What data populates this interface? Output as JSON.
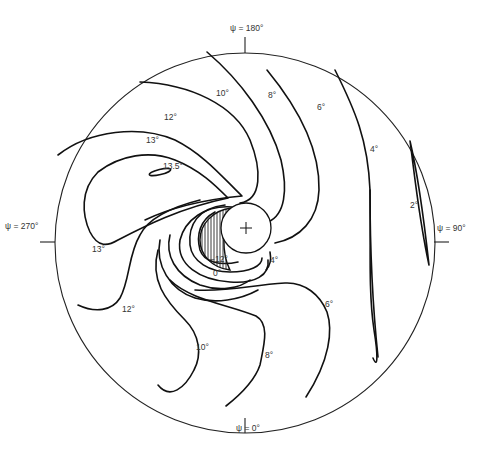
{
  "diagram": {
    "type": "polar contour map",
    "azimuth_labels": {
      "top": "ψ = 180°",
      "right": "ψ = 90°",
      "bottom": "ψ = 0°",
      "left": "ψ = 270°"
    },
    "contour_labels": {
      "c10_top": "10°",
      "c8_top": "8°",
      "c6_top": "6°",
      "c4": "4°",
      "c2": "2°",
      "c12_top": "12°",
      "c13_top": "13°",
      "c13_5": "13.5°",
      "c13_left": "13°",
      "c12_left": "12°",
      "c10_bottom": "10°",
      "c8_bottom": "8°",
      "c6_bottom": "6°",
      "c4_center": "4°",
      "c0": "0°",
      "cneg12": "−12°"
    },
    "contour_levels": [
      "−12°",
      "0°",
      "2°",
      "4°",
      "6°",
      "8°",
      "10°",
      "12°",
      "13°",
      "13.5°"
    ],
    "center_marker": "+",
    "shaded_region": "hatched crescent (values below −12°)"
  }
}
